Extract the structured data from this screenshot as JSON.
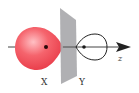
{
  "diagram": {
    "labels": {
      "left_lobe": "X",
      "right_lobe": "Y",
      "axis": "z"
    },
    "colors": {
      "left_lobe_fill": "#ee4a55",
      "left_lobe_highlight": "#ffb0b5",
      "plane_fill": "#a9a9ad",
      "axis_line": "#333333",
      "right_lobe_stroke": "#222222",
      "nucleus_dot": "#1a1a1a"
    }
  }
}
